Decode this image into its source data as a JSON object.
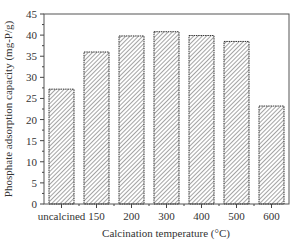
{
  "chart_data": {
    "type": "bar",
    "title": "",
    "xlabel": "Calcination temperature (°C)",
    "ylabel": "Phosphate adsorption capacity (mg-P/g)",
    "categories": [
      "uncalcined",
      "150",
      "200",
      "300",
      "400",
      "500",
      "600"
    ],
    "values": [
      27.2,
      36.0,
      39.8,
      40.8,
      39.9,
      38.5,
      23.2
    ],
    "ylim": [
      0,
      45
    ],
    "yticks": [
      0,
      5,
      10,
      15,
      20,
      25,
      30,
      35,
      40,
      45
    ],
    "grid": false,
    "legend": null,
    "bar_fill": "hatched (diagonal lines)",
    "colors": {
      "bar_edge": "#333333",
      "hatch": "#555555",
      "axis": "#444444"
    }
  }
}
